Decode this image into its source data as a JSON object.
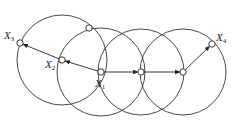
{
  "diagram": {
    "colors": {
      "stroke": "#333333",
      "background": "#ffffff"
    },
    "circles": [
      {
        "id": "circle-x2",
        "cx": 62,
        "cy": 60,
        "r": 45
      },
      {
        "id": "circle-x1",
        "cx": 101,
        "cy": 72,
        "r": 44
      },
      {
        "id": "circle-mid",
        "cx": 141,
        "cy": 72,
        "r": 43
      },
      {
        "id": "circle-right",
        "cx": 183,
        "cy": 72,
        "r": 43
      }
    ],
    "nodes": [
      {
        "id": "X1",
        "x": 101,
        "y": 72
      },
      {
        "id": "X2",
        "x": 62,
        "y": 60
      },
      {
        "id": "X3",
        "x": 20,
        "y": 43
      },
      {
        "id": "X4",
        "x": 212,
        "y": 44
      },
      {
        "id": "top",
        "x": 89,
        "y": 28
      },
      {
        "id": "mid",
        "x": 141,
        "y": 72
      },
      {
        "id": "right",
        "x": 183,
        "y": 72
      }
    ],
    "arrows": [
      {
        "from": "X1",
        "to": "X2"
      },
      {
        "from": "X2",
        "to": "X3"
      },
      {
        "from": "X1",
        "to": "mid"
      },
      {
        "from": "mid",
        "to": "right"
      },
      {
        "from": "right",
        "to": "X4"
      }
    ],
    "labels": [
      {
        "base": "X",
        "sub": "1",
        "x": 95,
        "y": 80
      },
      {
        "base": "X",
        "sub": "2",
        "x": 45,
        "y": 60
      },
      {
        "base": "X",
        "sub": "3",
        "x": 4,
        "y": 33
      },
      {
        "base": "X",
        "sub": "4",
        "x": 216,
        "y": 34
      }
    ]
  }
}
